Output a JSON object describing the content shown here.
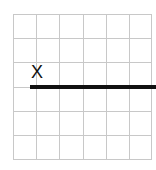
{
  "diagram": {
    "type": "grid-with-line",
    "grid": {
      "columns": 6,
      "rows": 6,
      "line_color": "#c8c8c8"
    },
    "label": {
      "text": "X",
      "color": "#111111"
    },
    "segment": {
      "color": "#111111",
      "start_column_line": 1,
      "row_line": 3,
      "extends_past_right_edge": true
    }
  }
}
